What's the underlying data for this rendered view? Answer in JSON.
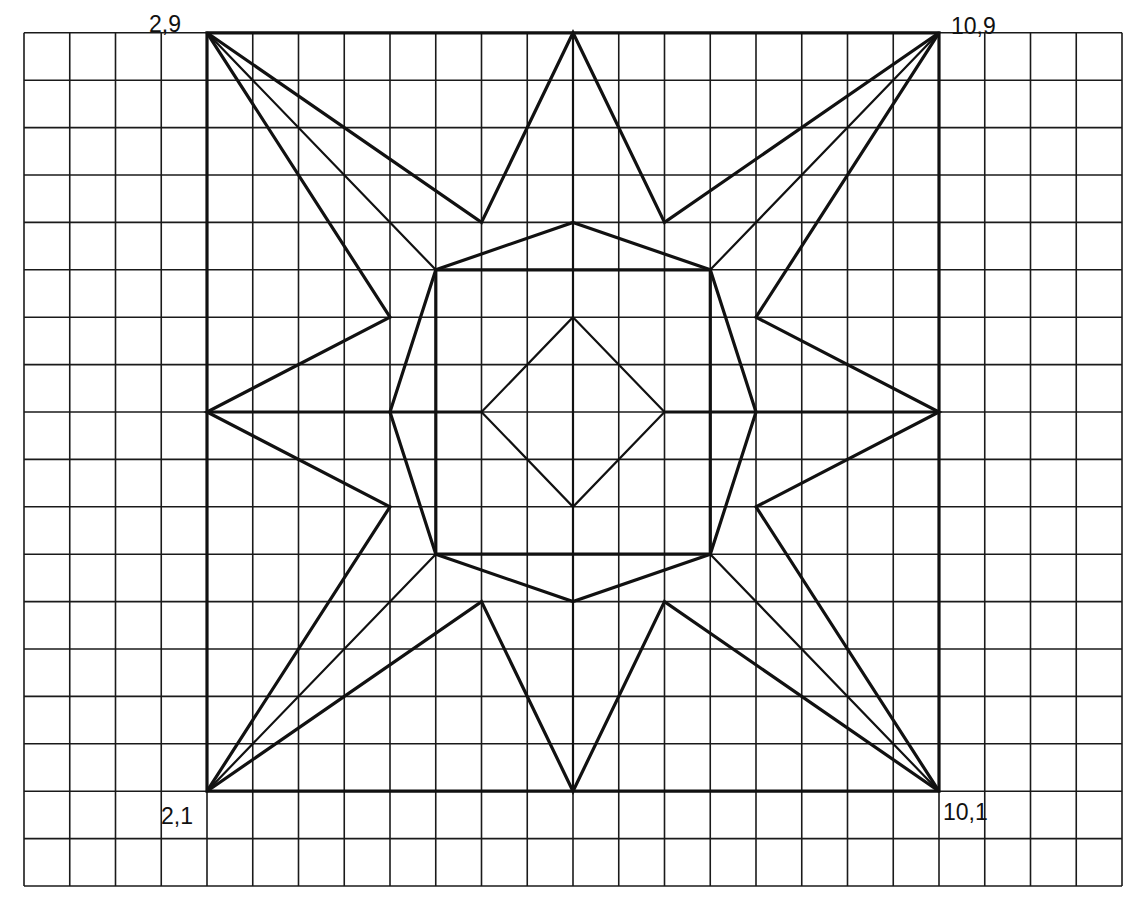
{
  "diagram": {
    "type": "geometric-star-on-grid",
    "grid": {
      "cols": 24,
      "rows": 18,
      "units_per_cell": 0.5,
      "u_range": [
        0,
        12
      ],
      "v_range": [
        0,
        9
      ]
    },
    "colors": {
      "line": "#111111",
      "grid": "#1a1a1a",
      "background": "#ffffff"
    },
    "labels": [
      {
        "text": "2,9",
        "point": [
          2,
          9
        ]
      },
      {
        "text": "10,9",
        "point": [
          10,
          9
        ]
      },
      {
        "text": "2,1",
        "point": [
          2,
          1
        ]
      },
      {
        "text": "10,1",
        "point": [
          10,
          1
        ]
      }
    ],
    "outer_square": [
      [
        2,
        9
      ],
      [
        10,
        9
      ],
      [
        10,
        1
      ],
      [
        2,
        1
      ]
    ],
    "star": [
      [
        6,
        9
      ],
      [
        5,
        7
      ],
      [
        2,
        9
      ],
      [
        4,
        6
      ],
      [
        2,
        5
      ],
      [
        4,
        4
      ],
      [
        2,
        1
      ],
      [
        5,
        3
      ],
      [
        6,
        1
      ],
      [
        7,
        3
      ],
      [
        10,
        1
      ],
      [
        8,
        4
      ],
      [
        10,
        5
      ],
      [
        8,
        6
      ],
      [
        10,
        9
      ],
      [
        7,
        7
      ]
    ],
    "octagon": [
      [
        6,
        7
      ],
      [
        7.5,
        6.5
      ],
      [
        8,
        5
      ],
      [
        7.5,
        3.5
      ],
      [
        6,
        3
      ],
      [
        4.5,
        3.5
      ],
      [
        4,
        5
      ],
      [
        4.5,
        6.5
      ]
    ],
    "inner_square": [
      [
        4.5,
        6.5
      ],
      [
        7.5,
        6.5
      ],
      [
        7.5,
        3.5
      ],
      [
        4.5,
        3.5
      ]
    ],
    "diamond": [
      [
        6,
        6
      ],
      [
        7,
        5
      ],
      [
        6,
        4
      ],
      [
        5,
        5
      ]
    ],
    "corner_diagonals": [
      [
        [
          2,
          9
        ],
        [
          4.5,
          6.5
        ]
      ],
      [
        [
          10,
          9
        ],
        [
          7.5,
          6.5
        ]
      ],
      [
        [
          10,
          1
        ],
        [
          7.5,
          3.5
        ]
      ],
      [
        [
          2,
          1
        ],
        [
          4.5,
          3.5
        ]
      ]
    ],
    "center_vertical": [
      [
        6,
        9
      ],
      [
        6,
        1
      ]
    ],
    "center_horizontal_segments": [
      [
        [
          2,
          5
        ],
        [
          5,
          5
        ]
      ],
      [
        [
          7,
          5
        ],
        [
          10,
          5
        ]
      ]
    ]
  }
}
